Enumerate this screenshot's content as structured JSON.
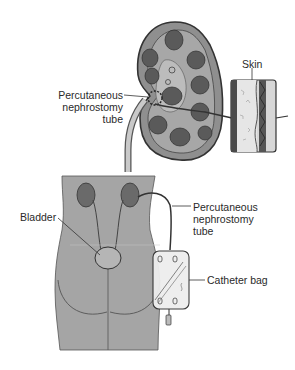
{
  "diagram": {
    "title": "Percutaneous nephrostomy",
    "labels": {
      "skin": "Skin",
      "tube_top": [
        "Percutaneous",
        "nephrostomy",
        "tube"
      ],
      "bladder": "Bladder",
      "tube_bottom": [
        "Percutaneous",
        "nephrostomy",
        "tube"
      ],
      "catheter_bag": "Catheter bag"
    },
    "colors": {
      "background": "#ffffff",
      "outline": "#333333",
      "kidney_cortex": "#9a9a9a",
      "pyramid": "#5e5e5e",
      "body": "#a9a9a9",
      "skin_layer": "#dcdcdc",
      "bag": "#ececec",
      "text": "#2a2a2a"
    }
  }
}
